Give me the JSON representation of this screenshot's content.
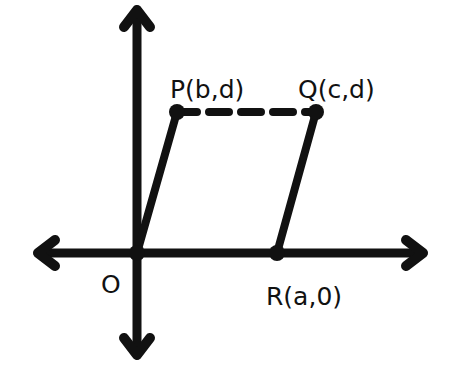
{
  "diagram": {
    "type": "coordinate-geometry",
    "colors": {
      "stroke": "#111111",
      "background": "#ffffff"
    },
    "axes": {
      "x_axis": {
        "bidirectional": true
      },
      "y_axis": {
        "bidirectional": true
      }
    },
    "points": [
      {
        "id": "O",
        "label": "O",
        "coords": "origin"
      },
      {
        "id": "P",
        "label": "P(b,d)"
      },
      {
        "id": "Q",
        "label": "Q(c,d)"
      },
      {
        "id": "R",
        "label": "R(a,0)"
      }
    ],
    "segments": [
      {
        "from": "O",
        "to": "P",
        "style": "solid"
      },
      {
        "from": "P",
        "to": "Q",
        "style": "dashed"
      },
      {
        "from": "Q",
        "to": "R",
        "style": "solid"
      },
      {
        "from": "O",
        "to": "R",
        "style": "solid (on x-axis)"
      }
    ]
  },
  "labels": {
    "origin": "O",
    "p": "P(b,d)",
    "q": "Q(c,d)",
    "r": "R(a,0)"
  }
}
